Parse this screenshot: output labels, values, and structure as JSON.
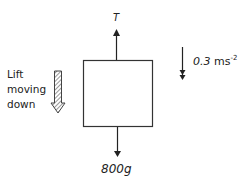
{
  "diagram": {
    "type": "free-body diagram",
    "body": {
      "shape": "square",
      "stroke": "#333333"
    },
    "forces": [
      {
        "label": "T",
        "direction": "up"
      },
      {
        "label": "800g",
        "direction": "down"
      }
    ],
    "acceleration": {
      "value": "0.3",
      "unit": "ms",
      "exponent": "-2",
      "direction": "down"
    },
    "motion": {
      "label_lines": [
        "Lift",
        "moving",
        "down"
      ],
      "direction": "down"
    }
  }
}
